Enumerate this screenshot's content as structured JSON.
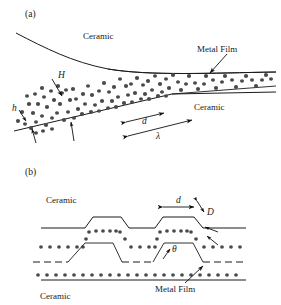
{
  "figure": {
    "panels": [
      {
        "id": "a",
        "tag": "(a)",
        "labels": {
          "ceramic_top": "Ceramic",
          "ceramic_bottom": "Ceramic",
          "metal_film": "Metal Film",
          "height_H": "H",
          "height_h": "h",
          "width_d": "d",
          "wavelength": "λ"
        }
      },
      {
        "id": "b",
        "tag": "(b)",
        "labels": {
          "ceramic_top": "Ceramic",
          "ceramic_bottom": "Ceramic",
          "metal_film": "Metal Film",
          "width_d": "d",
          "thickness_D": "D",
          "angle_theta": "θ"
        }
      }
    ],
    "colors": {
      "line": "#1a1a1a",
      "grain": "#4a4a4a",
      "background": "#ffffff",
      "text": "#1a1a1a"
    }
  }
}
